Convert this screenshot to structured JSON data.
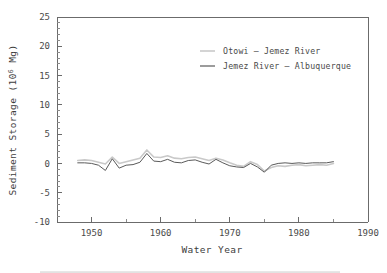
{
  "chart_data": {
    "type": "line",
    "title": "",
    "xlabel": "Water Year",
    "ylabel": "Sediment Storage (10⁶ Mg)",
    "ylabel_base": "Sediment Storage (10",
    "ylabel_exp": "6",
    "ylabel_tail": " Mg)",
    "xlim": [
      1945,
      1990
    ],
    "ylim": [
      -10,
      25
    ],
    "xticks": [
      1950,
      1960,
      1970,
      1980,
      1990
    ],
    "xtick_labels": [
      "1950",
      "1960",
      "1970",
      "1980",
      "1990"
    ],
    "xminor_ticks": [
      1955,
      1965,
      1975,
      1985
    ],
    "yticks": [
      -10,
      -5,
      0,
      5,
      10,
      15,
      20,
      25
    ],
    "ytick_labels": [
      "-10",
      "-5",
      "0",
      "5",
      "10",
      "15",
      "20",
      "25"
    ],
    "yminor_step": 1,
    "grid": false,
    "legend_position": "upper-right",
    "x": [
      1948,
      1949,
      1950,
      1951,
      1952,
      1953,
      1954,
      1955,
      1956,
      1957,
      1958,
      1959,
      1960,
      1961,
      1962,
      1963,
      1964,
      1965,
      1966,
      1967,
      1968,
      1969,
      1970,
      1971,
      1972,
      1973,
      1974,
      1975,
      1976,
      1977,
      1978,
      1979,
      1980,
      1981,
      1982,
      1983,
      1984,
      1985
    ],
    "series": [
      {
        "name": "Otowi – Jemez River",
        "color": "#c9c9c9",
        "width": 1.6,
        "values": [
          0.5,
          0.6,
          0.5,
          0.2,
          -0.1,
          1.1,
          0.0,
          0.3,
          0.6,
          0.9,
          2.3,
          1.1,
          1.0,
          1.3,
          0.9,
          0.8,
          1.0,
          1.1,
          0.8,
          0.5,
          0.9,
          0.6,
          0.1,
          -0.3,
          -0.5,
          0.3,
          -0.2,
          -1.3,
          -0.7,
          -0.4,
          -0.5,
          -0.3,
          -0.2,
          -0.4,
          -0.3,
          -0.2,
          -0.3,
          0.0
        ]
      },
      {
        "name": "Jemez River – Albuquerque",
        "color": "#5a5a5a",
        "width": 1.0,
        "values": [
          0.1,
          0.1,
          0.0,
          -0.3,
          -1.2,
          0.8,
          -0.8,
          -0.3,
          -0.2,
          0.2,
          1.7,
          0.4,
          0.3,
          0.7,
          0.2,
          0.1,
          0.5,
          0.6,
          0.2,
          -0.1,
          0.7,
          0.1,
          -0.4,
          -0.6,
          -0.7,
          0.0,
          -0.6,
          -1.5,
          -0.3,
          0.0,
          0.1,
          0.0,
          0.1,
          0.0,
          0.1,
          0.1,
          0.1,
          0.3
        ]
      }
    ]
  },
  "legend": {
    "items": [
      {
        "label": "Otowi – Jemez River",
        "swatch_color": "#c9c9c9"
      },
      {
        "label": "Jemez River – Albuquerque",
        "swatch_color": "#5a5a5a"
      }
    ]
  }
}
